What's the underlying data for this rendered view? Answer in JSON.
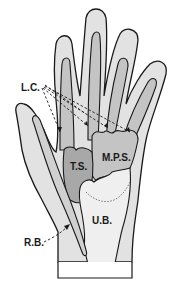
{
  "diagram": {
    "labels": {
      "lc": "L.C.",
      "ts": "T.S.",
      "mps": "M.P.S.",
      "ub": "U.B.",
      "rb": "R.B."
    },
    "colors": {
      "background": "#ffffff",
      "hand_fill": "#e2e2e2",
      "sheath_fill": "#c4c4c4",
      "ts_fill": "#a8a8a8",
      "ub_fill": "#efefef",
      "outline": "#1a1a1a"
    }
  }
}
